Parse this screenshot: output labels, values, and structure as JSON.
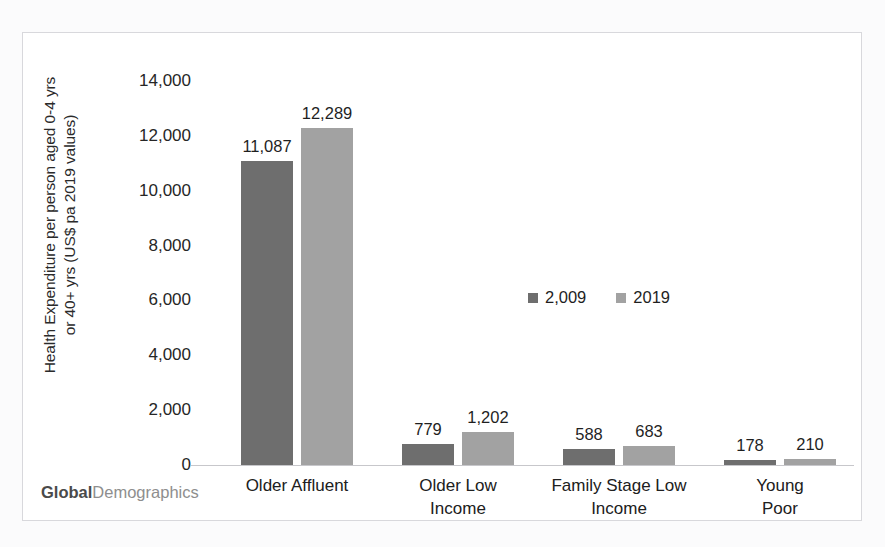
{
  "chart_data": {
    "type": "bar",
    "title": "",
    "xlabel": "",
    "ylabel": "Health Expenditure per person aged 0-4 yrs or 40+ yrs (US$ pa 2019 values)",
    "ylabel_line1": "Health Expenditure per person aged 0-4 yrs",
    "ylabel_line2": "or 40+ yrs (US$ pa 2019 values)",
    "categories": [
      "Older Affluent",
      "Older Low Income",
      "Family Stage Low Income",
      "Young Poor"
    ],
    "category_lines": [
      [
        "Older Affluent"
      ],
      [
        "Older Low",
        "Income"
      ],
      [
        "Family Stage Low",
        "Income"
      ],
      [
        "Young Poor"
      ]
    ],
    "series": [
      {
        "name": "2,009",
        "color": "#6e6e6e",
        "values": [
          11087,
          779,
          588,
          178
        ],
        "labels": [
          "11,087",
          "779",
          "588",
          "178"
        ]
      },
      {
        "name": "2019",
        "color": "#a2a2a2",
        "values": [
          12289,
          1202,
          683,
          210
        ],
        "labels": [
          "12,289",
          "1,202",
          "683",
          "210"
        ]
      }
    ],
    "ylim": [
      0,
      14000
    ],
    "ytick_values": [
      0,
      2000,
      4000,
      6000,
      8000,
      10000,
      12000,
      14000
    ],
    "ytick_labels": [
      "0",
      "2,000",
      "4,000",
      "6,000",
      "8,000",
      "10,000",
      "12,000",
      "14,000"
    ],
    "grid": false,
    "legend_position": "center",
    "legend": [
      "2,009",
      "2019"
    ]
  },
  "watermark": {
    "strong": "Global",
    "light": "Demographics"
  }
}
